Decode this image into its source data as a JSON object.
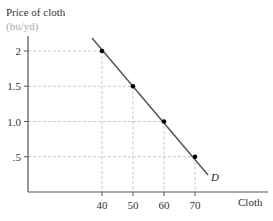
{
  "chart_data": {
    "type": "line",
    "title": "",
    "ylabel": "Price of cloth",
    "ylabel_unit": "(bu/yd)",
    "xlabel": "Cloth",
    "series": [
      {
        "name": "D",
        "x": [
          40,
          50,
          60,
          70
        ],
        "y": [
          2,
          1.5,
          1.0,
          0.5
        ]
      }
    ],
    "x_ticks": [
      "40",
      "50",
      "60",
      "70"
    ],
    "y_ticks": [
      "2",
      "1.5",
      "1.0",
      ".5"
    ],
    "grid": "dashed guide lines to each point",
    "colors": {
      "line": "#555555",
      "axis": "#555555",
      "guide": "#bbbbbb",
      "unit_label": "#aaaaaa",
      "point": "#000000"
    }
  }
}
